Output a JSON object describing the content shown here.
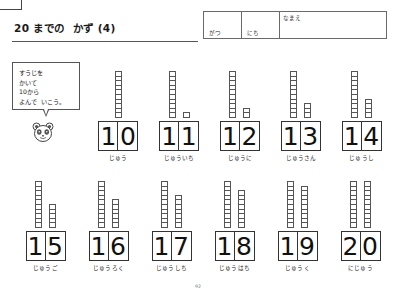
{
  "page": {
    "title": "20 までの  かず (4)",
    "page_number": "92"
  },
  "name_table": {
    "month_label": "がつ",
    "day_label": "にち",
    "name_label": "なまえ",
    "month_value": "",
    "day_value": "",
    "name_value": ""
  },
  "instruction": {
    "lines": "すうじを\nかいて\n10から\nよんで  いこう。",
    "mascot": "panda-face-icon"
  },
  "chart_data": {
    "type": "table",
    "title": "20 までの  かず (4)",
    "categories": [
      "10",
      "11",
      "12",
      "13",
      "14",
      "15",
      "16",
      "17",
      "18",
      "19",
      "20"
    ],
    "values": [
      10,
      11,
      12,
      13,
      14,
      15,
      16,
      17,
      18,
      19,
      20
    ],
    "xlabel": "",
    "ylabel": ""
  },
  "rows": [
    {
      "items": [
        {
          "number": "10",
          "digits": [
            "1",
            "0"
          ],
          "reading": "じゅう",
          "tens": 1,
          "ones": 0
        },
        {
          "number": "11",
          "digits": [
            "1",
            "1"
          ],
          "reading": "じゅういち",
          "tens": 1,
          "ones": 1
        },
        {
          "number": "12",
          "digits": [
            "1",
            "2"
          ],
          "reading": "じゅうに",
          "tens": 1,
          "ones": 2
        },
        {
          "number": "13",
          "digits": [
            "1",
            "3"
          ],
          "reading": "じゅうさん",
          "tens": 1,
          "ones": 3
        },
        {
          "number": "14",
          "digits": [
            "1",
            "4"
          ],
          "reading": "じゅうし",
          "tens": 1,
          "ones": 4
        }
      ]
    },
    {
      "items": [
        {
          "number": "15",
          "digits": [
            "1",
            "5"
          ],
          "reading": "じゅうご",
          "tens": 1,
          "ones": 5
        },
        {
          "number": "16",
          "digits": [
            "1",
            "6"
          ],
          "reading": "じゅうろく",
          "tens": 1,
          "ones": 6
        },
        {
          "number": "17",
          "digits": [
            "1",
            "7"
          ],
          "reading": "じゅうしち",
          "tens": 1,
          "ones": 7
        },
        {
          "number": "18",
          "digits": [
            "1",
            "8"
          ],
          "reading": "じゅうはち",
          "tens": 1,
          "ones": 8
        },
        {
          "number": "19",
          "digits": [
            "1",
            "9"
          ],
          "reading": "じゅうく",
          "tens": 1,
          "ones": 9
        },
        {
          "number": "20",
          "digits": [
            "2",
            "0"
          ],
          "reading": "にじゅう",
          "tens": 2,
          "ones": 0
        }
      ]
    }
  ]
}
